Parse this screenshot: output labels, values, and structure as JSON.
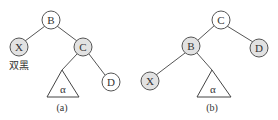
{
  "figure_a": {
    "caption": "(a)",
    "nodes": {
      "B": {
        "label": "B",
        "shade": "white"
      },
      "X": {
        "label": "X",
        "shade": "gray"
      },
      "C": {
        "label": "C",
        "shade": "gray"
      },
      "D": {
        "label": "D",
        "shade": "white"
      }
    },
    "subtree_label": "α",
    "annotation": "双黑"
  },
  "figure_b": {
    "caption": "(b)",
    "nodes": {
      "C": {
        "label": "C",
        "shade": "white"
      },
      "B": {
        "label": "B",
        "shade": "gray"
      },
      "D": {
        "label": "D",
        "shade": "gray"
      },
      "X": {
        "label": "X",
        "shade": "gray"
      }
    },
    "subtree_label": "α"
  },
  "colors": {
    "gray_node": "#e2e2e2",
    "white_node": "#ffffff",
    "stroke": "#555555"
  }
}
